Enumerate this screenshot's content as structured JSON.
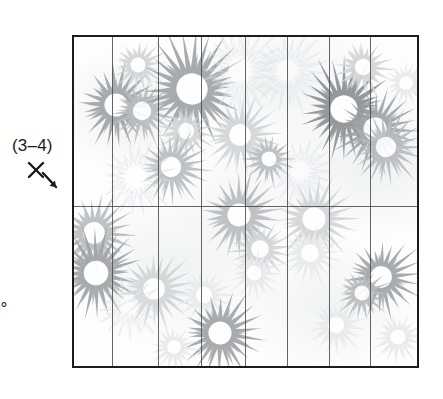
{
  "figure": {
    "type": "scatter",
    "caption_labels": {
      "range_label": "(3–4)",
      "axis_icon": "x-axis-down-right-arrow",
      "degree_label": "0°",
      "paren_label": ")"
    },
    "plot_area": {
      "x": 72,
      "y": 35,
      "width": 347,
      "height": 333,
      "border_color": "#1c1c1c",
      "background_color": "#fdfdfd",
      "grid": {
        "vertical_lines": [
          38,
          84,
          127,
          171,
          213,
          255,
          296
        ],
        "horizontal_lines": [
          169
        ],
        "line_color": "#4a4a4a",
        "columns": 8,
        "rows": 2
      }
    },
    "palette": {
      "darkest": "#8c8f92",
      "dark": "#a0a3a6",
      "mid": "#b9bcbf",
      "light": "#d2d5d7",
      "faint": "#e8eaec",
      "outline": "#f1f3f4",
      "center": "#ffffff"
    }
  },
  "chart_data": {
    "type": "scatter",
    "title": "",
    "xlabel": "",
    "ylabel": "",
    "grid": true,
    "legend": false,
    "marker": "chrysanthemum-flower",
    "xlim": [
      0,
      347
    ],
    "ylim": [
      0,
      333
    ],
    "annotations": [
      "(3–4)",
      "0°",
      ")"
    ],
    "points": [
      {
        "x": 42,
        "y": 68,
        "r": 34,
        "tone": "dark",
        "petals": 22,
        "rot": 12
      },
      {
        "x": 68,
        "y": 74,
        "r": 27,
        "tone": "mid",
        "petals": 20,
        "rot": 40
      },
      {
        "x": 64,
        "y": 28,
        "r": 22,
        "tone": "light",
        "petals": 18,
        "rot": 5
      },
      {
        "x": 118,
        "y": 52,
        "r": 46,
        "tone": "dark",
        "petals": 26,
        "rot": 18
      },
      {
        "x": 112,
        "y": 94,
        "r": 24,
        "tone": "light",
        "petals": 18,
        "rot": 60
      },
      {
        "x": 97,
        "y": 130,
        "r": 30,
        "tone": "mid",
        "petals": 22,
        "rot": 30
      },
      {
        "x": 62,
        "y": 140,
        "r": 29,
        "tone": "outline",
        "petals": 20,
        "rot": 15
      },
      {
        "x": 166,
        "y": 33,
        "r": 34,
        "tone": "outline",
        "petals": 24,
        "rot": 8
      },
      {
        "x": 213,
        "y": 34,
        "r": 30,
        "tone": "outline",
        "petals": 22,
        "rot": 44
      },
      {
        "x": 166,
        "y": 98,
        "r": 32,
        "tone": "light",
        "petals": 22,
        "rot": 22
      },
      {
        "x": 195,
        "y": 122,
        "r": 22,
        "tone": "mid",
        "petals": 18,
        "rot": 50
      },
      {
        "x": 226,
        "y": 134,
        "r": 26,
        "tone": "outline",
        "petals": 20,
        "rot": 10
      },
      {
        "x": 270,
        "y": 72,
        "r": 40,
        "tone": "darkest",
        "petals": 26,
        "rot": 14
      },
      {
        "x": 301,
        "y": 92,
        "r": 34,
        "tone": "dark",
        "petals": 24,
        "rot": 55
      },
      {
        "x": 312,
        "y": 110,
        "r": 30,
        "tone": "mid",
        "petals": 22,
        "rot": 25
      },
      {
        "x": 289,
        "y": 30,
        "r": 24,
        "tone": "light",
        "petals": 18,
        "rot": 35
      },
      {
        "x": 332,
        "y": 46,
        "r": 20,
        "tone": "faint",
        "petals": 18,
        "rot": 0
      },
      {
        "x": 20,
        "y": 196,
        "r": 32,
        "tone": "mid",
        "petals": 22,
        "rot": 28
      },
      {
        "x": 22,
        "y": 236,
        "r": 36,
        "tone": "dark",
        "petals": 24,
        "rot": 6
      },
      {
        "x": 80,
        "y": 252,
        "r": 32,
        "tone": "light",
        "petals": 22,
        "rot": 48
      },
      {
        "x": 56,
        "y": 268,
        "r": 26,
        "tone": "outline",
        "petals": 18,
        "rot": 20
      },
      {
        "x": 130,
        "y": 258,
        "r": 24,
        "tone": "faint",
        "petals": 18,
        "rot": 30
      },
      {
        "x": 165,
        "y": 178,
        "r": 34,
        "tone": "mid",
        "petals": 22,
        "rot": 16
      },
      {
        "x": 186,
        "y": 212,
        "r": 26,
        "tone": "light",
        "petals": 20,
        "rot": 58
      },
      {
        "x": 146,
        "y": 296,
        "r": 34,
        "tone": "dark",
        "petals": 22,
        "rot": 34
      },
      {
        "x": 180,
        "y": 236,
        "r": 22,
        "tone": "faint",
        "petals": 18,
        "rot": 12
      },
      {
        "x": 240,
        "y": 182,
        "r": 34,
        "tone": "light",
        "petals": 22,
        "rot": 24
      },
      {
        "x": 236,
        "y": 216,
        "r": 26,
        "tone": "faint",
        "petals": 20,
        "rot": 42
      },
      {
        "x": 262,
        "y": 288,
        "r": 24,
        "tone": "faint",
        "petals": 18,
        "rot": 18
      },
      {
        "x": 307,
        "y": 240,
        "r": 32,
        "tone": "dark",
        "petals": 22,
        "rot": 52
      },
      {
        "x": 288,
        "y": 256,
        "r": 22,
        "tone": "mid",
        "petals": 18,
        "rot": 10
      },
      {
        "x": 324,
        "y": 300,
        "r": 22,
        "tone": "faint",
        "petals": 18,
        "rot": 26
      },
      {
        "x": 100,
        "y": 310,
        "r": 20,
        "tone": "faint",
        "petals": 18,
        "rot": 36
      }
    ]
  }
}
